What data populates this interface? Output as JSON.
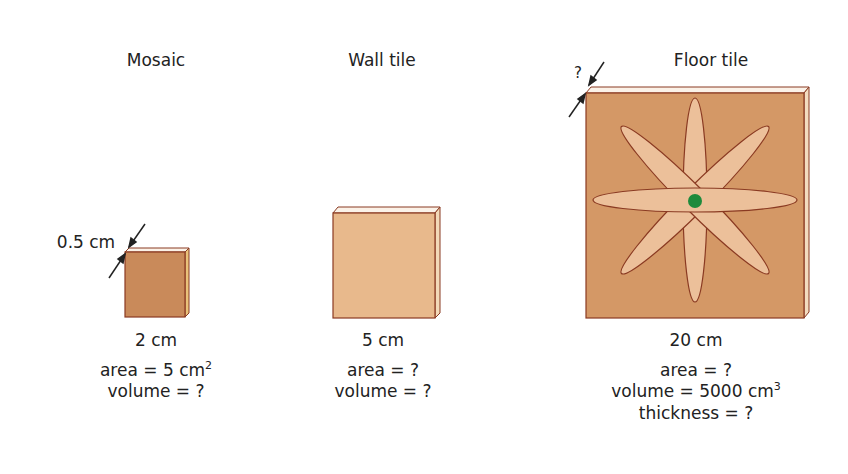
{
  "diagram": {
    "tiles": [
      {
        "name": "Mosaic",
        "side": "2 cm",
        "thickness_label": "0.5 cm",
        "area_text": "area = 5 cm",
        "area_sup": "2",
        "volume_text": "volume = ?",
        "color": "#c98a5a"
      },
      {
        "name": "Wall tile",
        "side": "5 cm",
        "area_text": "area = ?",
        "volume_text": "volume = ?",
        "color": "#e8b98c"
      },
      {
        "name": "Floor tile",
        "side": "20 cm",
        "thickness_label": "?",
        "area_text": "area = ?",
        "volume_text": "volume = 5000 cm",
        "volume_sup": "3",
        "thickness_text": "thickness = ?",
        "color": "#d49866",
        "petal_color": "#ecc09a",
        "center_color": "#1e8a3c"
      }
    ]
  }
}
